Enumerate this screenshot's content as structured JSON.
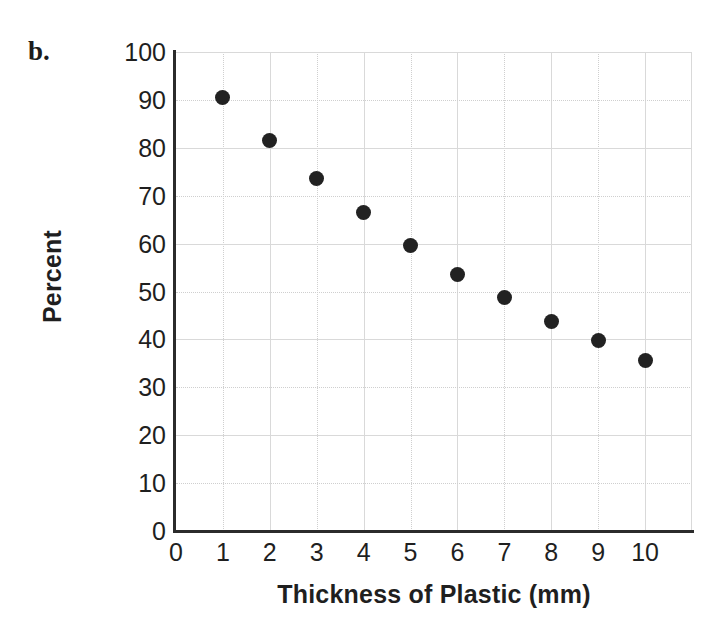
{
  "figure": {
    "part_label": "b."
  },
  "chart_data": {
    "type": "scatter",
    "title": "",
    "xlabel": "Thickness of Plastic (mm)",
    "ylabel": "Percent",
    "xlim": [
      0,
      11
    ],
    "ylim": [
      0,
      100
    ],
    "xticks": [
      "0",
      "1",
      "2",
      "3",
      "4",
      "5",
      "6",
      "7",
      "8",
      "9",
      "10"
    ],
    "xtick_values": [
      0,
      1,
      2,
      3,
      4,
      5,
      6,
      7,
      8,
      9,
      10
    ],
    "yticks": [
      "0",
      "10",
      "20",
      "30",
      "40",
      "50",
      "60",
      "70",
      "80",
      "90",
      "100"
    ],
    "ytick_values": [
      0,
      10,
      20,
      30,
      40,
      50,
      60,
      70,
      80,
      90,
      100
    ],
    "grid": true,
    "legend": false,
    "marker": "filled-circle",
    "marker_color": "#222222",
    "grid_color": "#d9d9d9",
    "axis_color": "#2b2b2b",
    "x": [
      1,
      2,
      3,
      4,
      5,
      6,
      7,
      8,
      9,
      10
    ],
    "values": [
      90.5,
      81.5,
      73.5,
      66.5,
      59.5,
      53.5,
      48.8,
      43.8,
      39.8,
      35.6
    ],
    "points": [
      {
        "x": 1,
        "y": 90.5
      },
      {
        "x": 2,
        "y": 81.5
      },
      {
        "x": 3,
        "y": 73.5
      },
      {
        "x": 4,
        "y": 66.5
      },
      {
        "x": 5,
        "y": 59.5
      },
      {
        "x": 6,
        "y": 53.5
      },
      {
        "x": 7,
        "y": 48.8
      },
      {
        "x": 8,
        "y": 43.8
      },
      {
        "x": 9,
        "y": 39.8
      },
      {
        "x": 10,
        "y": 35.6
      }
    ]
  }
}
